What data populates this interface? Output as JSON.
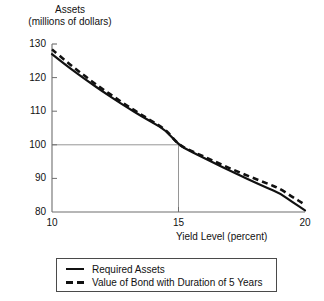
{
  "chart_data": {
    "type": "line",
    "title": "",
    "xlabel": "Yield Level (percent)",
    "ylabel_line1": "Assets",
    "ylabel_line2": "(millions of dollars)",
    "xlim": [
      10,
      20
    ],
    "ylim": [
      80,
      130
    ],
    "xticks": [
      "10",
      "15",
      "20"
    ],
    "yticks": [
      "130",
      "120",
      "110",
      "100",
      "90",
      "80"
    ],
    "grid": false,
    "legend_position": "below-plot",
    "reference_lines": {
      "horizontal_y": 100,
      "vertical_x": 15,
      "color": "#8a8a8a"
    },
    "x": [
      10,
      10.5,
      11,
      11.5,
      12,
      12.5,
      13,
      13.5,
      14,
      14.5,
      15,
      15.5,
      16,
      16.5,
      17,
      17.5,
      18,
      18.5,
      19,
      19.5,
      20
    ],
    "series": [
      {
        "name": "Required Assets",
        "style": "solid",
        "color": "#111111",
        "values": [
          127.0,
          124.0,
          121.2,
          118.5,
          115.9,
          113.4,
          111.0,
          108.7,
          106.5,
          104.3,
          100.0,
          98.0,
          96.1,
          94.2,
          92.4,
          90.6,
          88.9,
          87.2,
          85.6,
          83.0,
          80.5
        ]
      },
      {
        "name": "Value of Bond with Duration of 5 Years",
        "style": "dashed",
        "color": "#111111",
        "values": [
          128.4,
          125.2,
          122.2,
          119.3,
          116.6,
          114.0,
          111.5,
          109.1,
          106.8,
          104.5,
          100.0,
          98.2,
          96.5,
          94.8,
          93.1,
          91.5,
          90.0,
          88.5,
          87.0,
          84.5,
          82.2
        ]
      }
    ]
  },
  "legend": {
    "items": [
      {
        "label": "Required Assets",
        "style": "solid"
      },
      {
        "label": "Value of Bond with Duration of 5 Years",
        "style": "dashed"
      }
    ]
  }
}
